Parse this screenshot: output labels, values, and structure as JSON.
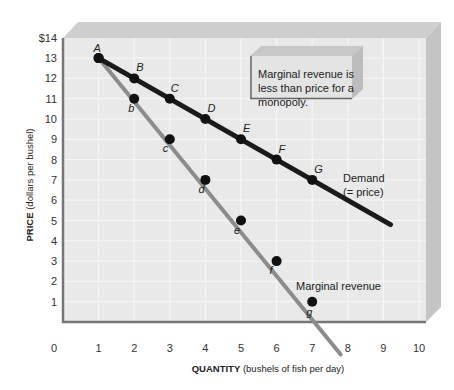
{
  "chart_data": {
    "type": "line",
    "title": "",
    "xlabel_bold": "QUANTITY",
    "xlabel_rest": " (bushels of fish per day)",
    "ylabel_bold": "PRICE",
    "ylabel_rest": " (dollars per bushel)",
    "xlim": [
      0,
      10
    ],
    "ylim": [
      0,
      14
    ],
    "x_ticks": [
      "0",
      "1",
      "2",
      "3",
      "4",
      "5",
      "6",
      "7",
      "8",
      "9",
      "10"
    ],
    "y_ticks": [
      "1",
      "2",
      "3",
      "4",
      "5",
      "6",
      "7",
      "8",
      "9",
      "10",
      "11",
      "12",
      "13",
      "$14"
    ],
    "grid": true,
    "series": [
      {
        "name": "Demand (= price)",
        "label_line1": "Demand",
        "label_line2": "(= price)",
        "color": "#1a1a1a",
        "x": [
          1,
          2,
          3,
          4,
          5,
          6,
          7
        ],
        "y": [
          13,
          12,
          11,
          10,
          9,
          8,
          7
        ],
        "point_labels": [
          "A",
          "B",
          "C",
          "D",
          "E",
          "F",
          "G"
        ],
        "line_extends_to": [
          9.2,
          4.8
        ]
      },
      {
        "name": "Marginal revenue",
        "color": "#8c8c8c",
        "x": [
          1,
          2,
          3,
          4,
          5,
          6,
          7
        ],
        "y": [
          13,
          11,
          9,
          7,
          5,
          3,
          1
        ],
        "point_labels": [
          "",
          "b",
          "c",
          "d",
          "e",
          "f",
          "g"
        ],
        "line_extends_to": [
          7.8,
          -1.6
        ]
      }
    ],
    "annotation": "Marginal revenue is less than price for a monopoly."
  }
}
